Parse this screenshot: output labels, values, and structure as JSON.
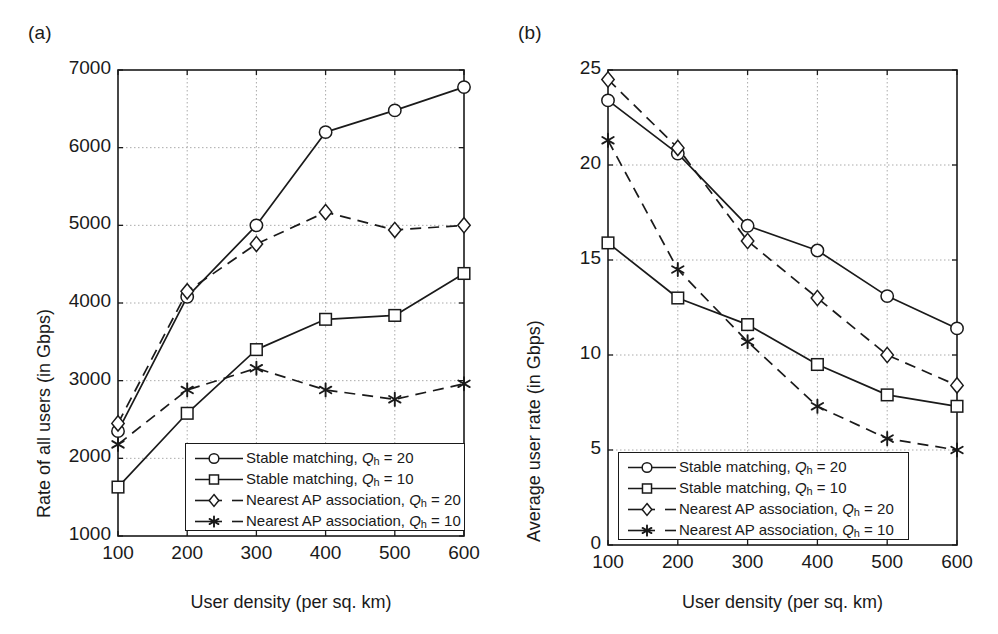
{
  "figure": {
    "panels": [
      {
        "tag": "a",
        "label": "(a)"
      },
      {
        "tag": "b",
        "label": "(b)"
      }
    ]
  },
  "legend": {
    "entries": [
      {
        "marker": "circle",
        "line": "solid",
        "name": "Stable matching",
        "q_symbol": "Q",
        "q_sub": "h",
        "q_eq": "=",
        "q_value": "20",
        "full_label": "Stable matching, Qh = 20"
      },
      {
        "marker": "square",
        "line": "solid",
        "name": "Stable matching",
        "q_symbol": "Q",
        "q_sub": "h",
        "q_eq": "=",
        "q_value": "10",
        "full_label": "Stable matching, Qh = 10"
      },
      {
        "marker": "diamond",
        "line": "dashed",
        "name": "Nearest AP association",
        "q_symbol": "Q",
        "q_sub": "h",
        "q_eq": "=",
        "q_value": "20",
        "full_label": "Nearest AP association, Qh = 20"
      },
      {
        "marker": "asterisk",
        "line": "dashed",
        "name": "Nearest AP association",
        "q_symbol": "Q",
        "q_sub": "h",
        "q_eq": "=",
        "q_value": "10",
        "full_label": "Nearest AP association, Qh = 10"
      }
    ]
  },
  "colors": {
    "line": "#1a1a1a",
    "grid": "#aaaaaa",
    "axis": "#1a1a1a",
    "background": "#ffffff"
  },
  "chart_data": [
    {
      "panel": "a",
      "type": "line",
      "title": "",
      "xlabel": "User density (per sq. km)",
      "ylabel": "Rate of all users (in Gbps)",
      "x": [
        100,
        200,
        300,
        400,
        500,
        600
      ],
      "xticks": [
        "100",
        "200",
        "300",
        "400",
        "500",
        "600"
      ],
      "yticks": [
        "1000",
        "2000",
        "3000",
        "4000",
        "5000",
        "6000",
        "7000"
      ],
      "ytickvals": [
        1000,
        2000,
        3000,
        4000,
        5000,
        6000,
        7000
      ],
      "xlim": [
        100,
        600
      ],
      "ylim": [
        1000,
        7000
      ],
      "grid": true,
      "legend_position": "lower-center",
      "series": [
        {
          "name": "Stable matching, Qh = 20",
          "marker": "circle",
          "line": "solid",
          "values": [
            2350,
            4080,
            5000,
            6200,
            6480,
            6780
          ]
        },
        {
          "name": "Stable matching, Qh = 10",
          "marker": "square",
          "line": "solid",
          "values": [
            1630,
            2580,
            3400,
            3790,
            3840,
            4380
          ]
        },
        {
          "name": "Nearest AP association, Qh = 20",
          "marker": "diamond",
          "line": "dashed",
          "values": [
            2450,
            4150,
            4760,
            5170,
            4940,
            5000
          ]
        },
        {
          "name": "Nearest AP association, Qh = 10",
          "marker": "asterisk",
          "line": "dashed",
          "values": [
            2180,
            2880,
            3160,
            2880,
            2760,
            2960
          ]
        }
      ]
    },
    {
      "panel": "b",
      "type": "line",
      "title": "",
      "xlabel": "User density (per sq. km)",
      "ylabel": "Average user rate (in Gbps)",
      "x": [
        100,
        200,
        300,
        400,
        500,
        600
      ],
      "xticks": [
        "100",
        "200",
        "300",
        "400",
        "500",
        "600"
      ],
      "yticks": [
        "0",
        "5",
        "10",
        "15",
        "20",
        "25"
      ],
      "ytickvals": [
        0,
        5,
        10,
        15,
        20,
        25
      ],
      "xlim": [
        100,
        600
      ],
      "ylim": [
        0,
        25
      ],
      "grid": true,
      "legend_position": "lower-center",
      "series": [
        {
          "name": "Stable matching, Qh = 20",
          "marker": "circle",
          "line": "solid",
          "values": [
            23.4,
            20.6,
            16.8,
            15.5,
            13.1,
            11.4
          ]
        },
        {
          "name": "Stable matching, Qh = 10",
          "marker": "square",
          "line": "solid",
          "values": [
            15.9,
            13.0,
            11.6,
            9.5,
            7.9,
            7.3
          ]
        },
        {
          "name": "Nearest AP association, Qh = 20",
          "marker": "diamond",
          "line": "dashed",
          "values": [
            24.5,
            20.9,
            16.0,
            13.0,
            10.0,
            8.4
          ]
        },
        {
          "name": "Nearest AP association, Qh = 10",
          "marker": "asterisk",
          "line": "dashed",
          "values": [
            21.3,
            14.5,
            10.7,
            7.3,
            5.6,
            5.0
          ]
        }
      ]
    }
  ]
}
